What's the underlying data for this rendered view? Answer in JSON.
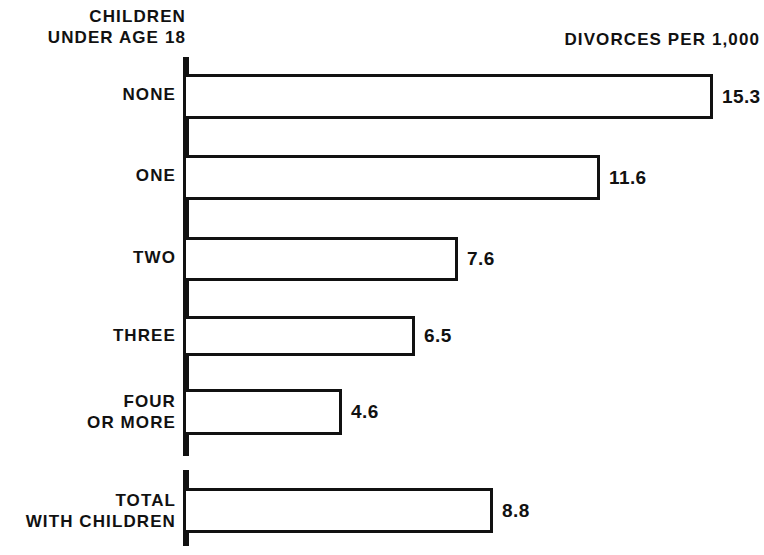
{
  "header": {
    "left_line1": "CHILDREN",
    "left_line2": "UNDER AGE 18",
    "right": "DIVORCES PER 1,000"
  },
  "colors": {
    "ink": "#111111",
    "background": "#ffffff",
    "bar_fill": "#ffffff"
  },
  "chart_data": {
    "type": "bar",
    "orientation": "horizontal",
    "title": "DIVORCES PER 1,000",
    "xlabel": "DIVORCES PER 1,000",
    "ylabel": "CHILDREN UNDER AGE 18",
    "grid": false,
    "legend": "none",
    "xlim": [
      0,
      16.5
    ],
    "categories": [
      "NONE",
      "ONE",
      "TWO",
      "THREE",
      "FOUR OR MORE",
      "TOTAL WITH CHILDREN"
    ],
    "values": [
      15.3,
      11.6,
      7.6,
      6.5,
      4.6,
      8.8
    ],
    "value_labels": [
      "15.3",
      "11.6",
      "7.6",
      "6.5",
      "4.6",
      "8.8"
    ],
    "series": [
      {
        "name": "Divorces per 1,000",
        "values": [
          15.3,
          11.6,
          7.6,
          6.5,
          4.6,
          8.8
        ]
      }
    ]
  },
  "bars": [
    {
      "label_line1": "NONE",
      "label_line2": "",
      "value": "15.3",
      "top": 74,
      "height": 45,
      "width": 527,
      "label_top": 84
    },
    {
      "label_line1": "ONE",
      "label_line2": "",
      "value": "11.6",
      "top": 155,
      "height": 45,
      "width": 414,
      "label_top": 165
    },
    {
      "label_line1": "TWO",
      "label_line2": "",
      "value": "7.6",
      "top": 237,
      "height": 44,
      "width": 272,
      "label_top": 247
    },
    {
      "label_line1": "THREE",
      "label_line2": "",
      "value": "6.5",
      "top": 316,
      "height": 40,
      "width": 229,
      "label_top": 325
    },
    {
      "label_line1": "FOUR",
      "label_line2": "OR MORE",
      "value": "4.6",
      "top": 389,
      "height": 46,
      "width": 156,
      "label_top": 391
    },
    {
      "label_line1": "TOTAL",
      "label_line2": "WITH CHILDREN",
      "value": "8.8",
      "top": 488,
      "height": 45,
      "width": 307,
      "label_top": 490
    }
  ],
  "axis_segments": [
    {
      "top": 57,
      "height": 399
    },
    {
      "top": 470,
      "height": 76
    }
  ]
}
